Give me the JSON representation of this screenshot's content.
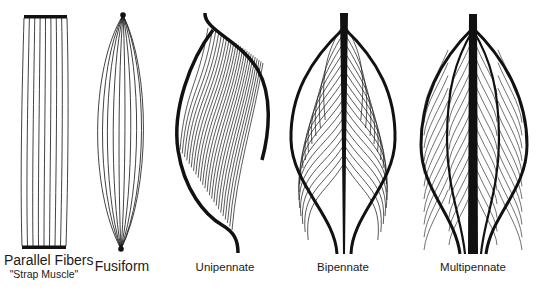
{
  "diagram": {
    "stroke_color": "#111111",
    "background": "#ffffff",
    "muscles": [
      {
        "id": "parallel",
        "label": "Parallel Fibers",
        "sublabel": "\"Strap Muscle\""
      },
      {
        "id": "fusiform",
        "label": "Fusiform"
      },
      {
        "id": "unipennate",
        "label": "Unipennate"
      },
      {
        "id": "bipennate",
        "label": "Bipennate"
      },
      {
        "id": "multipennate",
        "label": "Multipennate"
      }
    ]
  }
}
